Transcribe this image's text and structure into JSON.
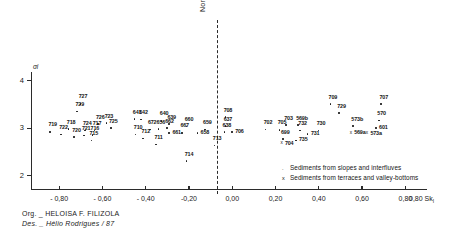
{
  "chart_data": {
    "type": "scatter",
    "title": "",
    "xlabel": "Sk I",
    "ylabel": "σi",
    "xlim": [
      -0.93,
      0.9
    ],
    "ylim": [
      1.72,
      4.18
    ],
    "grid": false,
    "x_ticks": [
      -0.8,
      -0.6,
      -0.4,
      -0.2,
      0.0,
      0.2,
      0.4,
      0.6,
      0.8
    ],
    "x_tick_labels": [
      "- 0,80",
      "- 0,60",
      "- 0,40",
      "-0,20",
      "0,00",
      "0,20",
      "0,40",
      "0,60",
      "0,80"
    ],
    "y_ticks": [
      4,
      3,
      2
    ],
    "y_tick_labels": [
      "4",
      "3",
      "2"
    ],
    "annotation_line": {
      "label": "Normal curve",
      "x": 0.0,
      "style": "dashed"
    },
    "series": [
      {
        "name": "Sediments from slopes and interfluves",
        "marker": "dot",
        "points": [
          {
            "label": "727",
            "x": -0.705,
            "y": 3.53,
            "lbl_pos": "above"
          },
          {
            "label": "729",
            "x": -0.72,
            "y": 3.37,
            "lbl_pos": "above"
          },
          {
            "label": "726",
            "x": -0.625,
            "y": 3.1,
            "lbl_pos": "above"
          },
          {
            "label": "723",
            "x": -0.585,
            "y": 3.12,
            "lbl_pos": "above"
          },
          {
            "label": "725",
            "x": -0.565,
            "y": 3.02,
            "lbl_pos": "above"
          },
          {
            "label": "719",
            "x": -0.845,
            "y": 2.94,
            "lbl_pos": "above"
          },
          {
            "label": "718",
            "x": -0.76,
            "y": 3.0,
            "lbl_pos": "above"
          },
          {
            "label": "724",
            "x": -0.685,
            "y": 2.97,
            "lbl_pos": "above"
          },
          {
            "label": "717",
            "x": -0.64,
            "y": 2.97,
            "lbl_pos": "above"
          },
          {
            "label": "722",
            "x": -0.795,
            "y": 2.88,
            "lbl_pos": "above"
          },
          {
            "label": "720",
            "x": -0.735,
            "y": 2.83,
            "lbl_pos": "above"
          },
          {
            "label": "721",
            "x": -0.69,
            "y": 2.86,
            "lbl_pos": "above"
          },
          {
            "label": "716",
            "x": -0.65,
            "y": 2.87,
            "lbl_pos": "above"
          },
          {
            "label": "715",
            "x": -0.655,
            "y": 2.76,
            "lbl_pos": "above"
          },
          {
            "label": "641",
            "x": -0.455,
            "y": 3.21,
            "lbl_pos": "above"
          },
          {
            "label": "642",
            "x": -0.425,
            "y": 3.2,
            "lbl_pos": "above"
          },
          {
            "label": "640",
            "x": -0.33,
            "y": 3.17,
            "lbl_pos": "above"
          },
          {
            "label": "639",
            "x": -0.295,
            "y": 3.1,
            "lbl_pos": "above"
          },
          {
            "label": "656",
            "x": -0.345,
            "y": 3.0,
            "lbl_pos": "above"
          },
          {
            "label": "662",
            "x": -0.305,
            "y": 3.02,
            "lbl_pos": "above"
          },
          {
            "label": "660",
            "x": -0.215,
            "y": 3.05,
            "lbl_pos": "above"
          },
          {
            "label": "661",
            "x": -0.295,
            "y": 2.92,
            "lbl_pos": "right"
          },
          {
            "label": "667",
            "x": -0.235,
            "y": 2.92,
            "lbl_pos": "above"
          },
          {
            "label": "672",
            "x": -0.385,
            "y": 2.99,
            "lbl_pos": "above"
          },
          {
            "label": "710",
            "x": -0.45,
            "y": 2.88,
            "lbl_pos": "above"
          },
          {
            "label": "712",
            "x": -0.415,
            "y": 2.8,
            "lbl_pos": "above"
          },
          {
            "label": "711",
            "x": -0.355,
            "y": 2.67,
            "lbl_pos": "above"
          },
          {
            "label": "714",
            "x": -0.215,
            "y": 2.32,
            "lbl_pos": "above"
          },
          {
            "label": "659",
            "x": -0.13,
            "y": 2.99,
            "lbl_pos": "above"
          },
          {
            "label": "658",
            "x": -0.165,
            "y": 2.91,
            "lbl_pos": "right"
          },
          {
            "label": "708",
            "x": -0.035,
            "y": 3.25,
            "lbl_pos": "above"
          },
          {
            "label": "637",
            "x": -0.035,
            "y": 3.06,
            "lbl_pos": "above"
          },
          {
            "label": "638",
            "x": -0.04,
            "y": 2.93,
            "lbl_pos": "above"
          },
          {
            "label": "706",
            "x": -0.005,
            "y": 2.93,
            "lbl_pos": "right"
          },
          {
            "label": "713",
            "x": -0.085,
            "y": 2.65,
            "lbl_pos": "above"
          },
          {
            "label": "709",
            "x": 0.45,
            "y": 3.52,
            "lbl_pos": "above"
          },
          {
            "label": "707",
            "x": 0.685,
            "y": 3.52,
            "lbl_pos": "above"
          },
          {
            "label": "729",
            "x": 0.49,
            "y": 3.33,
            "lbl_pos": "above"
          },
          {
            "label": "703",
            "x": 0.245,
            "y": 3.08,
            "lbl_pos": "above"
          },
          {
            "label": "569b",
            "x": 0.3,
            "y": 3.08,
            "lbl_pos": "above"
          },
          {
            "label": "573b",
            "x": 0.555,
            "y": 3.06,
            "lbl_pos": "above"
          },
          {
            "label": "570",
            "x": 0.675,
            "y": 3.18,
            "lbl_pos": "above"
          },
          {
            "label": "601",
            "x": 0.66,
            "y": 3.02,
            "lbl_pos": "right"
          },
          {
            "label": "702",
            "x": 0.15,
            "y": 2.99,
            "lbl_pos": "above"
          },
          {
            "label": "705",
            "x": 0.215,
            "y": 2.98,
            "lbl_pos": "above"
          },
          {
            "label": "732",
            "x": 0.31,
            "y": 2.97,
            "lbl_pos": "above"
          },
          {
            "label": "730",
            "x": 0.395,
            "y": 2.97,
            "lbl_pos": "above"
          },
          {
            "label": "731",
            "x": 0.345,
            "y": 2.89,
            "lbl_pos": "right"
          },
          {
            "label": "699",
            "x": 0.23,
            "y": 2.79,
            "lbl_pos": "above"
          },
          {
            "label": "735",
            "x": 0.29,
            "y": 2.76,
            "lbl_pos": "right"
          }
        ]
      },
      {
        "name": "Sediments from terraces and valley-bottoms",
        "marker": "cross",
        "points": [
          {
            "label": "704",
            "x": 0.225,
            "y": 2.69,
            "lbl_pos": "right"
          },
          {
            "label": "569a",
            "x": 0.545,
            "y": 2.91,
            "lbl_pos": "right"
          },
          {
            "label": "573a",
            "x": 0.62,
            "y": 2.9,
            "lbl_pos": "right"
          }
        ]
      }
    ]
  },
  "legend": {
    "position": "bottom-right",
    "items": [
      {
        "marker": ".",
        "label": "Sediments from slopes and interfluves"
      },
      {
        "marker": "x",
        "label": "Sediments from terraces and valley-bottoms"
      }
    ]
  },
  "credits": {
    "org": "Org. _ HELOISA F. FILIZOLA",
    "des": "Des. _ Hélio  Rodrigues / 87"
  }
}
